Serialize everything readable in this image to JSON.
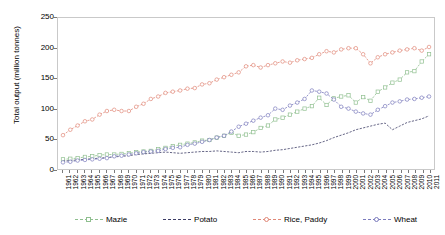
{
  "chart_data": {
    "type": "line",
    "title": "",
    "xlabel": "",
    "ylabel": "Total output (million tonnes)",
    "ylim": [
      0,
      250
    ],
    "yticks": [
      0,
      50,
      100,
      150,
      200,
      250
    ],
    "grid": false,
    "legend_position": "bottom",
    "x": [
      1961,
      1962,
      1963,
      1964,
      1965,
      1966,
      1967,
      1968,
      1969,
      1970,
      1971,
      1972,
      1973,
      1974,
      1975,
      1976,
      1977,
      1978,
      1979,
      1980,
      1981,
      1982,
      1983,
      1984,
      1985,
      1986,
      1987,
      1988,
      1989,
      1990,
      1991,
      1992,
      1993,
      1994,
      1995,
      1996,
      1997,
      1998,
      1999,
      2000,
      2001,
      2002,
      2003,
      2004,
      2005,
      2006,
      2007,
      2008,
      2009,
      2010,
      2011
    ],
    "series": [
      {
        "name": "Mazie",
        "color": "#8fbf8f",
        "marker": "square",
        "values": [
          16,
          17,
          18,
          20,
          21,
          23,
          24,
          24,
          25,
          26,
          28,
          29,
          30,
          33,
          35,
          38,
          40,
          42,
          44,
          47,
          48,
          52,
          55,
          60,
          55,
          57,
          61,
          68,
          72,
          82,
          85,
          90,
          95,
          100,
          104,
          118,
          106,
          117,
          120,
          122,
          110,
          119,
          113,
          128,
          135,
          143,
          148,
          160,
          162,
          178,
          190
        ]
      },
      {
        "name": "Potato",
        "color": "#3d3d66",
        "marker": "none",
        "values": [
          13,
          14,
          15,
          16,
          17,
          18,
          19,
          20,
          21,
          22,
          24,
          25,
          26,
          27,
          28,
          27,
          26,
          27,
          28,
          29,
          29,
          30,
          29,
          28,
          27,
          29,
          29,
          28,
          29,
          31,
          32,
          34,
          36,
          38,
          40,
          43,
          47,
          52,
          56,
          60,
          65,
          68,
          71,
          74,
          76,
          65,
          71,
          77,
          80,
          83,
          88
        ]
      },
      {
        "name": "Rice, Paddy",
        "color": "#e08878",
        "marker": "circle",
        "values": [
          56,
          65,
          72,
          79,
          82,
          90,
          96,
          98,
          96,
          96,
          103,
          108,
          116,
          120,
          126,
          128,
          130,
          133,
          134,
          140,
          142,
          148,
          152,
          156,
          160,
          170,
          172,
          168,
          172,
          175,
          178,
          176,
          180,
          182,
          184,
          190,
          195,
          193,
          198,
          200,
          200,
          190,
          175,
          185,
          190,
          193,
          196,
          198,
          200,
          196,
          202
        ]
      },
      {
        "name": "Wheat",
        "color": "#7b7bbd",
        "marker": "circle",
        "values": [
          11,
          12,
          14,
          15,
          16,
          17,
          18,
          21,
          22,
          24,
          26,
          28,
          29,
          30,
          33,
          35,
          36,
          40,
          42,
          45,
          48,
          52,
          55,
          62,
          70,
          75,
          80,
          85,
          89,
          100,
          98,
          105,
          110,
          116,
          130,
          128,
          125,
          115,
          103,
          100,
          95,
          92,
          90,
          98,
          104,
          110,
          112,
          115,
          116,
          118,
          120
        ]
      }
    ]
  },
  "axes": {
    "ytick_labels": [
      "250",
      "200",
      "150",
      "100",
      "50",
      "0"
    ],
    "xtick_labels": [
      "1961",
      "1962",
      "1963",
      "1964",
      "1965",
      "1966",
      "1967",
      "1968",
      "1969",
      "1970",
      "1971",
      "1972",
      "1973",
      "1974",
      "1975",
      "1976",
      "1977",
      "1978",
      "1979",
      "1980",
      "1981",
      "1982",
      "1983",
      "1984",
      "1985",
      "1986",
      "1987",
      "1988",
      "1989",
      "1990",
      "1991",
      "1992",
      "1993",
      "1994",
      "1995",
      "1996",
      "1997",
      "1998",
      "1999",
      "2000",
      "2001",
      "2002",
      "2003",
      "2004",
      "2005",
      "2006",
      "2007",
      "2008",
      "2009",
      "2010",
      "2011"
    ]
  },
  "legend": {
    "items": [
      {
        "label": "Mazie",
        "color": "#8fbf8f"
      },
      {
        "label": "Potato",
        "color": "#3d3d66"
      },
      {
        "label": "Rice, Paddy",
        "color": "#e08878"
      },
      {
        "label": "Wheat",
        "color": "#7b7bbd"
      }
    ]
  }
}
